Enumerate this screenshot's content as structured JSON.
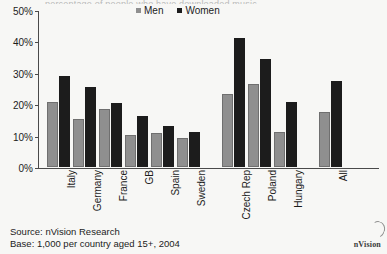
{
  "figure": {
    "title_cropped": "percentage of people who have downloaded music",
    "source_line": "Source: nVision Research",
    "base_line": "Base: 1,000 per country aged 15+, 2004",
    "brand": "nVision",
    "brand_mark_icon": "swoosh-icon"
  },
  "legend": {
    "position": "top-center",
    "entries": [
      {
        "label": "Men",
        "color": "#8f8f8f",
        "swatch_icon": "square-swatch-icon"
      },
      {
        "label": "Women",
        "color": "#1c1c1c",
        "swatch_icon": "square-swatch-icon"
      }
    ]
  },
  "axis": {
    "y_ticks": [
      "0%",
      "10%",
      "20%",
      "30%",
      "40%",
      "50%"
    ],
    "y_values": [
      0,
      10,
      20,
      30,
      40,
      50
    ]
  },
  "chart_data": {
    "type": "bar",
    "title": "percentage of people who have downloaded music",
    "xlabel": "",
    "ylabel": "",
    "ylim": [
      0,
      50
    ],
    "ytick_labels": [
      "0%",
      "10%",
      "20%",
      "30%",
      "40%",
      "50%"
    ],
    "grid": false,
    "legend_position": "top-center",
    "categories": [
      "Italy",
      "Germany",
      "France",
      "GB",
      "Spain",
      "Sweden",
      "Czech Rep",
      "Poland",
      "Hungary",
      "All"
    ],
    "series": [
      {
        "name": "Men",
        "color": "#8f8f8f",
        "values": [
          20.7,
          15.3,
          18.5,
          10.3,
          10.8,
          9.2,
          23.4,
          26.5,
          11.2,
          17.5
        ]
      },
      {
        "name": "Women",
        "color": "#1c1c1c",
        "values": [
          28.9,
          25.6,
          20.3,
          16.3,
          13.2,
          11.0,
          41.0,
          34.5,
          20.8,
          27.5
        ]
      }
    ],
    "group_gaps_after": [
      "Sweden",
      "Hungary"
    ],
    "units": "percent"
  }
}
